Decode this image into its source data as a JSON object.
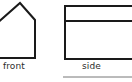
{
  "canvas": {
    "width": 132,
    "height": 82,
    "background_color": "#ffffff",
    "stroke_color": "#1a1a1a",
    "rule_color": "#777777"
  },
  "diagram": {
    "title_text": "",
    "views": [
      {
        "id": "front",
        "label": "front",
        "shape": "house-pentagon-outline",
        "clipped_edges": [
          "left"
        ],
        "stroke_width": 2,
        "points": "-6,26 20,3 35,20 35,58 -6,58",
        "label_x": 3,
        "label_y": 61
      },
      {
        "id": "side",
        "label": "side",
        "shape": "rectangle-with-horizontal-divider",
        "clipped_edges": [
          "right"
        ],
        "stroke_width": 2,
        "rect": {
          "x": 65,
          "y": 6,
          "width": 72,
          "height": 53
        },
        "divider_y": 21,
        "label_x": 82,
        "label_y": 61
      }
    ],
    "footer_rule": {
      "id": "bottom-rule",
      "x1": 63,
      "x2": 138,
      "y": 77,
      "stroke_width": 1
    }
  },
  "labels": {
    "front": "front",
    "side": "side"
  }
}
